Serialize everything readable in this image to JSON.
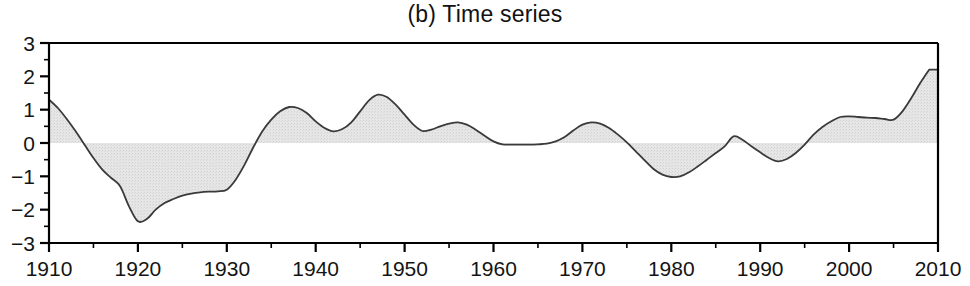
{
  "chart_title": "(b) Time series",
  "chart_data": {
    "type": "area",
    "title": "(b) Time series",
    "xlabel": "",
    "ylabel": "",
    "xlim": [
      1910,
      2010
    ],
    "ylim": [
      -3,
      3
    ],
    "grid": false,
    "legend": null,
    "zero_reference_line": 0,
    "fill_color": "#e2e2e2",
    "line_color": "#3a3a3a",
    "axis_color": "#000000",
    "background_color": "#ffffff",
    "x_ticks_major": [
      1910,
      1920,
      1930,
      1940,
      1950,
      1960,
      1970,
      1980,
      1990,
      2000,
      2010
    ],
    "x_tick_labels": [
      "1910",
      "1920",
      "1930",
      "1940",
      "1950",
      "1960",
      "1970",
      "1980",
      "1990",
      "2000",
      "2010"
    ],
    "x_ticks_minor_step": 5,
    "y_ticks_major": [
      3,
      2,
      1,
      0,
      -1,
      -2,
      -3
    ],
    "y_tick_labels": [
      "3",
      "2",
      "1",
      "0",
      "−1",
      "−2",
      "−3"
    ],
    "y_ticks_minor_step": 0.5,
    "x": [
      1910,
      1911,
      1912,
      1913,
      1914,
      1915,
      1916,
      1917,
      1918,
      1919,
      1920,
      1921,
      1922,
      1923,
      1924,
      1925,
      1926,
      1927,
      1928,
      1929,
      1930,
      1931,
      1932,
      1933,
      1934,
      1935,
      1936,
      1937,
      1938,
      1939,
      1940,
      1941,
      1942,
      1943,
      1944,
      1945,
      1946,
      1947,
      1948,
      1949,
      1950,
      1951,
      1952,
      1953,
      1954,
      1955,
      1956,
      1957,
      1958,
      1959,
      1960,
      1961,
      1962,
      1963,
      1964,
      1965,
      1966,
      1967,
      1968,
      1969,
      1970,
      1971,
      1972,
      1973,
      1974,
      1975,
      1976,
      1977,
      1978,
      1979,
      1980,
      1981,
      1982,
      1983,
      1984,
      1985,
      1986,
      1987,
      1988,
      1989,
      1990,
      1991,
      1992,
      1993,
      1994,
      1995,
      1996,
      1997,
      1998,
      1999,
      2000,
      2001,
      2002,
      2003,
      2004,
      2005,
      2006,
      2007,
      2008,
      2009
    ],
    "values": [
      1.3,
      1.05,
      0.72,
      0.35,
      -0.05,
      -0.45,
      -0.8,
      -1.05,
      -1.3,
      -1.9,
      -2.35,
      -2.28,
      -2.0,
      -1.8,
      -1.68,
      -1.58,
      -1.52,
      -1.48,
      -1.46,
      -1.45,
      -1.4,
      -1.1,
      -0.65,
      -0.12,
      0.35,
      0.7,
      0.95,
      1.08,
      1.05,
      0.9,
      0.65,
      0.45,
      0.35,
      0.42,
      0.62,
      0.95,
      1.28,
      1.45,
      1.38,
      1.15,
      0.85,
      0.55,
      0.36,
      0.4,
      0.5,
      0.58,
      0.62,
      0.55,
      0.4,
      0.22,
      0.05,
      -0.04,
      -0.05,
      -0.05,
      -0.05,
      -0.04,
      -0.02,
      0.05,
      0.18,
      0.38,
      0.55,
      0.62,
      0.58,
      0.45,
      0.25,
      0.02,
      -0.25,
      -0.52,
      -0.78,
      -0.95,
      -1.02,
      -1.0,
      -0.88,
      -0.7,
      -0.5,
      -0.3,
      -0.1,
      0.2,
      0.1,
      -0.1,
      -0.28,
      -0.45,
      -0.55,
      -0.48,
      -0.3,
      -0.05,
      0.25,
      0.48,
      0.65,
      0.78,
      0.8,
      0.78,
      0.76,
      0.75,
      0.72,
      0.7,
      0.95,
      1.35,
      1.8,
      2.2
    ]
  }
}
